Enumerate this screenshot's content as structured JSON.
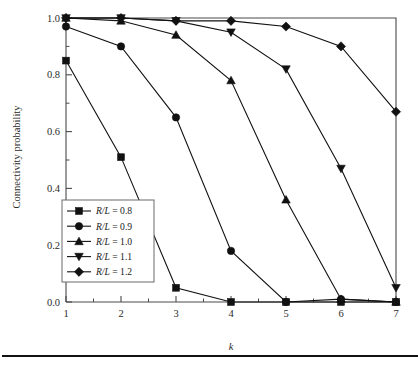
{
  "figure": {
    "background_color": "#ffffff",
    "line_color": "#111111",
    "axis_color": "#4a4a4a",
    "footer_rule": "horizontal-rule"
  },
  "chart_data": {
    "type": "line",
    "title": "",
    "xlabel": "k",
    "ylabel": "Connectivity probability",
    "x": [
      1,
      2,
      3,
      4,
      5,
      6,
      7
    ],
    "xlim": [
      1,
      7
    ],
    "ylim": [
      0.0,
      1.0
    ],
    "xticks": [
      "1",
      "2",
      "3",
      "4",
      "5",
      "6",
      "7"
    ],
    "yticks": [
      "0.0",
      "0.2",
      "0.4",
      "0.6",
      "0.8",
      "1.0"
    ],
    "ytick_values": [
      0.0,
      0.2,
      0.4,
      0.6,
      0.8,
      1.0
    ],
    "minor_ticks": true,
    "grid": false,
    "legend_position": "lower-left",
    "series": [
      {
        "name": "R/L = 0.8",
        "label_prefix": "R/L",
        "label_value": "0.8",
        "marker": "square",
        "values": [
          0.85,
          0.51,
          0.05,
          0.0,
          0.0,
          0.0,
          0.0
        ]
      },
      {
        "name": "R/L = 0.9",
        "label_prefix": "R/L",
        "label_value": "0.9",
        "marker": "circle",
        "values": [
          0.97,
          0.9,
          0.65,
          0.18,
          0.0,
          0.01,
          0.0
        ]
      },
      {
        "name": "R/L = 1.0",
        "label_prefix": "R/L",
        "label_value": "1.0",
        "marker": "triangle-up",
        "values": [
          1.0,
          0.99,
          0.94,
          0.78,
          0.36,
          0.01,
          0.0
        ]
      },
      {
        "name": "R/L = 1.1",
        "label_prefix": "R/L",
        "label_value": "1.1",
        "marker": "triangle-down",
        "values": [
          1.0,
          1.0,
          0.99,
          0.95,
          0.82,
          0.47,
          0.05
        ]
      },
      {
        "name": "R/L = 1.2",
        "label_prefix": "R/L",
        "label_value": "1.2",
        "marker": "diamond",
        "values": [
          1.0,
          1.0,
          0.99,
          0.99,
          0.97,
          0.9,
          0.67
        ]
      }
    ]
  },
  "legend": {
    "entries": [
      {
        "text": "R/L = 0.8",
        "marker": "square"
      },
      {
        "text": "R/L = 0.9",
        "marker": "circle"
      },
      {
        "text": "R/L = 1.0",
        "marker": "triangle-up"
      },
      {
        "text": "R/L = 1.1",
        "marker": "triangle-down"
      },
      {
        "text": "R/L = 1.2",
        "marker": "diamond"
      }
    ]
  }
}
